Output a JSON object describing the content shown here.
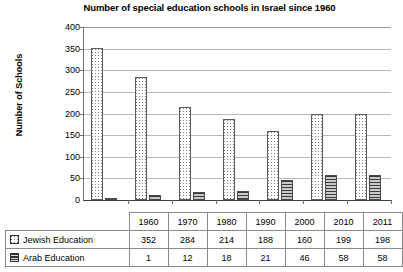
{
  "chart_data": {
    "type": "bar",
    "title": "Number of special education schools in Israel since 1960",
    "xlabel": "",
    "ylabel": "Number of Schools",
    "ylim": [
      0,
      400
    ],
    "ytick_interval": 50,
    "yticks": [
      "400",
      "350",
      "300",
      "250",
      "200",
      "150",
      "100",
      "50",
      "0"
    ],
    "grid": true,
    "legend_position": "table-row-headers",
    "categories": [
      "1960",
      "1970",
      "1980",
      "1990",
      "2000",
      "2010",
      "2011"
    ],
    "series": [
      {
        "name": "Jewish Education",
        "swatch": "dotted-square-icon",
        "values": [
          352,
          284,
          214,
          188,
          160,
          199,
          198
        ]
      },
      {
        "name": "Arab Education",
        "swatch": "horizontal-lines-square-icon",
        "values": [
          1,
          12,
          18,
          21,
          46,
          58,
          58
        ]
      }
    ]
  },
  "table": {
    "corner_label": "",
    "column_headers": [
      "1960",
      "1970",
      "1980",
      "1990",
      "2000",
      "2010",
      "2011"
    ],
    "rows": [
      {
        "label": "Jewish Education",
        "cells": [
          "352",
          "284",
          "214",
          "188",
          "160",
          "199",
          "198"
        ]
      },
      {
        "label": "Arab Education",
        "cells": [
          "1",
          "12",
          "18",
          "21",
          "46",
          "58",
          "58"
        ]
      }
    ]
  }
}
